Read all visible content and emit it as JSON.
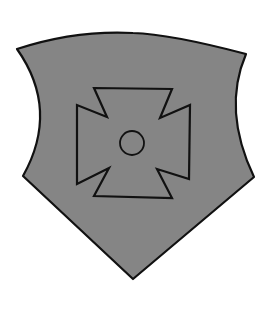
{
  "image": {
    "subject": "heraldic shield with cross pattée",
    "width": 273,
    "height": 312
  },
  "colors": {
    "background": "#ffffff",
    "shield_fill": "#858585",
    "outline": "#111111"
  },
  "shield": {
    "path": "M17,49 Q75,30 133,33 Q170,34 246,54 Q222,110 254,177 L133,279 L23,176 Q60,110 17,49 Z",
    "stroke_width": 2.2
  },
  "cross": {
    "points": "94,88 172,89 160,118 190,105 189,179 157,169 172,198 94,196 109,168 77,184 77,105 107,117",
    "stroke_width": 2.2
  },
  "boss": {
    "cx": 132,
    "cy": 143,
    "r": 12,
    "stroke_width": 1.8
  }
}
